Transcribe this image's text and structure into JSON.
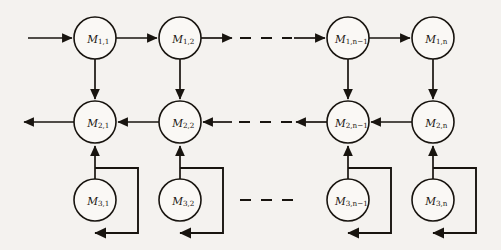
{
  "diagram": {
    "type": "directed-graph",
    "canvas": {
      "width": 501,
      "height": 250
    },
    "style": {
      "background_color": "#f4f2ef",
      "stroke_color": "#18140f",
      "node_fill": "#faf8f5",
      "node_radius": 21
    },
    "rows": [
      {
        "id": "row-1",
        "row_index": 1,
        "y": 38,
        "flow_direction": "left-to-right",
        "nodes": [
          {
            "id": "m-1-1",
            "label": "M",
            "sub": "1,1",
            "cx": 95,
            "cy": 38
          },
          {
            "id": "m-1-2",
            "label": "M",
            "sub": "1,2",
            "cx": 180,
            "cy": 38
          },
          {
            "id": "m-1-n-1",
            "label": "M",
            "sub": "1,n−1",
            "cx": 348,
            "cy": 38
          },
          {
            "id": "m-1-n",
            "label": "M",
            "sub": "1,n",
            "cx": 433,
            "cy": 38
          }
        ]
      },
      {
        "id": "row-2",
        "row_index": 2,
        "y": 122,
        "flow_direction": "right-to-left",
        "nodes": [
          {
            "id": "m-2-1",
            "label": "M",
            "sub": "2,1",
            "cx": 95,
            "cy": 122
          },
          {
            "id": "m-2-2",
            "label": "M",
            "sub": "2,2",
            "cx": 180,
            "cy": 122
          },
          {
            "id": "m-2-n-1",
            "label": "M",
            "sub": "2,n−1",
            "cx": 348,
            "cy": 122
          },
          {
            "id": "m-2-n",
            "label": "M",
            "sub": "2,n",
            "cx": 433,
            "cy": 122
          }
        ]
      },
      {
        "id": "row-3",
        "row_index": 3,
        "y": 200,
        "flow_direction": "upward-with-self-loop",
        "nodes": [
          {
            "id": "m-3-1",
            "label": "M",
            "sub": "3,1",
            "cx": 95,
            "cy": 200
          },
          {
            "id": "m-3-2",
            "label": "M",
            "sub": "3,2",
            "cx": 180,
            "cy": 200
          },
          {
            "id": "m-3-n-1",
            "label": "M",
            "sub": "3,n−1",
            "cx": 348,
            "cy": 200
          },
          {
            "id": "m-3-n",
            "label": "M",
            "sub": "3,n",
            "cx": 433,
            "cy": 200
          }
        ]
      }
    ],
    "ellipses": [
      {
        "id": "ellipsis-row-1",
        "row": 1,
        "y": 38,
        "x1": 228,
        "x2": 300,
        "arrows": true
      },
      {
        "id": "ellipsis-row-2",
        "row": 2,
        "y": 122,
        "x1": 228,
        "x2": 300,
        "arrows": true
      },
      {
        "id": "ellipsis-row-3",
        "row": 3,
        "y": 200,
        "x1": 228,
        "x2": 300,
        "arrows": false
      }
    ],
    "external_edges": [
      {
        "id": "input-arrow",
        "label": "",
        "from_x": 28,
        "to_x": 74,
        "y": 38,
        "direction": "right"
      },
      {
        "id": "output-arrow",
        "label": "",
        "from_x": 74,
        "to_x": 22,
        "y": 122,
        "direction": "left"
      }
    ]
  }
}
